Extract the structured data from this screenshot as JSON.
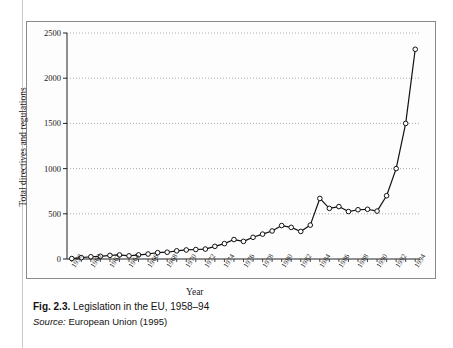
{
  "figure": {
    "caption_label": "Fig. 2.3.",
    "caption_text": " Legislation in the EU, 1958–94",
    "source_label": "Source:",
    "source_text": " European Union (1995)",
    "page_header_ghost": ""
  },
  "chart_data": {
    "type": "line",
    "title": "",
    "xlabel": "Year",
    "ylabel": "Total directives and regulations",
    "xlim": [
      1957.5,
      1994.5
    ],
    "ylim": [
      0,
      2500
    ],
    "yticks": [
      0,
      500,
      1000,
      1500,
      2000,
      2500
    ],
    "ytick_labels": [
      "0",
      "500",
      "1000",
      "1500",
      "2000",
      "2500"
    ],
    "xticks": [
      1958,
      1960,
      1962,
      1964,
      1966,
      1968,
      1970,
      1972,
      1974,
      1976,
      1978,
      1980,
      1982,
      1984,
      1986,
      1988,
      1990,
      1992,
      1994
    ],
    "xtick_labels": [
      "1958",
      "1960",
      "1962",
      "1964",
      "1966",
      "1968",
      "1970",
      "1972",
      "1974",
      "1976",
      "1978",
      "1980",
      "1982",
      "1984",
      "1986",
      "1988",
      "1990",
      "1992",
      "1994"
    ],
    "x_minor_tick_step": 1,
    "grid": "horizontal-dotted",
    "legend": "none",
    "marker": "open-circle",
    "line_color": "#111111",
    "marker_face_color": "#ffffff",
    "grid_color": "#999999",
    "x": [
      1958,
      1959,
      1960,
      1961,
      1962,
      1963,
      1964,
      1965,
      1966,
      1967,
      1968,
      1969,
      1970,
      1971,
      1972,
      1973,
      1974,
      1975,
      1976,
      1977,
      1978,
      1979,
      1980,
      1981,
      1982,
      1983,
      1984,
      1985,
      1986,
      1987,
      1988,
      1989,
      1990,
      1991,
      1992,
      1993,
      1994
    ],
    "values": [
      5,
      15,
      25,
      30,
      40,
      45,
      35,
      45,
      55,
      70,
      75,
      90,
      100,
      105,
      110,
      140,
      170,
      215,
      195,
      240,
      275,
      310,
      370,
      350,
      305,
      375,
      670,
      560,
      580,
      525,
      545,
      550,
      530,
      700,
      1000,
      1500,
      2320
    ],
    "series": [
      {
        "name": "Total directives and regulations",
        "values": [
          5,
          15,
          25,
          30,
          40,
          45,
          35,
          45,
          55,
          70,
          75,
          90,
          100,
          105,
          110,
          140,
          170,
          215,
          195,
          240,
          275,
          310,
          370,
          350,
          305,
          375,
          670,
          560,
          580,
          525,
          545,
          550,
          530,
          700,
          1000,
          1500,
          2320
        ]
      }
    ]
  }
}
